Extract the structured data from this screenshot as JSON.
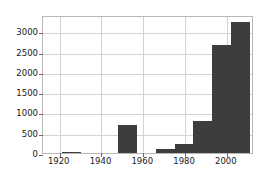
{
  "chart_data": {
    "type": "bar",
    "title": "",
    "subtitle": "",
    "xlabel": "",
    "ylabel": "",
    "xlim": [
      1912,
      2013
    ],
    "ylim": [
      0,
      3400
    ],
    "grid": true,
    "legend": null,
    "bar_color": "#3d3d3d",
    "grid_color": "#d3d3d3",
    "axis_color": "#b8b8b8",
    "xticks": [
      1920,
      1940,
      1960,
      1980,
      2000
    ],
    "xtick_labels": [
      "1920",
      "1940",
      "1960",
      "1980",
      "2000"
    ],
    "yticks": [
      0,
      500,
      1000,
      1500,
      2000,
      2500,
      3000
    ],
    "ytick_labels": [
      "0",
      "500",
      "1000",
      "1500",
      "2000",
      "2500",
      "3000"
    ],
    "bins": [
      {
        "start": 1912,
        "end": 1921,
        "value": 0
      },
      {
        "start": 1921,
        "end": 1930,
        "value": 8
      },
      {
        "start": 1930,
        "end": 1939,
        "value": 0
      },
      {
        "start": 1939,
        "end": 1948,
        "value": 0
      },
      {
        "start": 1948,
        "end": 1957,
        "value": 690
      },
      {
        "start": 1957,
        "end": 1966,
        "value": 0
      },
      {
        "start": 1966,
        "end": 1975,
        "value": 110
      },
      {
        "start": 1975,
        "end": 1984,
        "value": 215
      },
      {
        "start": 1984,
        "end": 1993,
        "value": 780
      },
      {
        "start": 1993,
        "end": 2002,
        "value": 2670
      },
      {
        "start": 2002,
        "end": 2011,
        "value": 3240
      }
    ]
  }
}
